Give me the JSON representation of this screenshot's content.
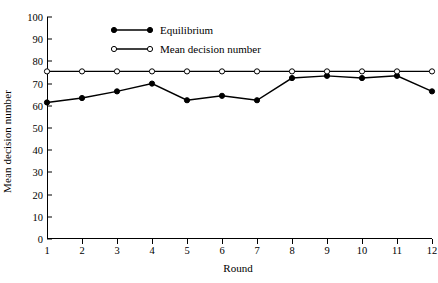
{
  "chart_data": {
    "type": "line",
    "title": "",
    "xlabel": "Round",
    "ylabel": "Mean decision number",
    "x": [
      1,
      2,
      3,
      4,
      5,
      6,
      7,
      8,
      9,
      10,
      11,
      12
    ],
    "xtick_labels": [
      "1",
      "2",
      "3",
      "4",
      "5",
      "6",
      "7",
      "8",
      "9",
      "10",
      "11",
      "12"
    ],
    "ytick_labels": [
      "0",
      "10",
      "20",
      "30",
      "40",
      "50",
      "60",
      "70",
      "80",
      "90",
      "100"
    ],
    "yticks": [
      0,
      10,
      20,
      30,
      40,
      50,
      60,
      70,
      80,
      90,
      100
    ],
    "xlim": [
      1,
      12
    ],
    "ylim": [
      0,
      100
    ],
    "grid": false,
    "legend_position": "top-left-inside",
    "series": [
      {
        "name": "Equilibrium",
        "marker": "filled-circle",
        "color": "#000000",
        "values": [
          61.5,
          63.5,
          66.5,
          70.0,
          62.5,
          64.5,
          62.5,
          72.5,
          73.5,
          72.5,
          73.5,
          66.5
        ]
      },
      {
        "name": "Mean decision number",
        "marker": "open-circle",
        "color": "#000000",
        "values": [
          75.5,
          75.5,
          75.5,
          75.5,
          75.5,
          75.5,
          75.5,
          75.5,
          75.5,
          75.5,
          75.5,
          75.5
        ]
      }
    ]
  },
  "legend": {
    "items": [
      {
        "label": "Equilibrium",
        "marker": "filled-circle"
      },
      {
        "label": "Mean decision number",
        "marker": "open-circle"
      }
    ]
  },
  "axes": {
    "x_title": "Round",
    "y_title": "Mean decision number"
  }
}
